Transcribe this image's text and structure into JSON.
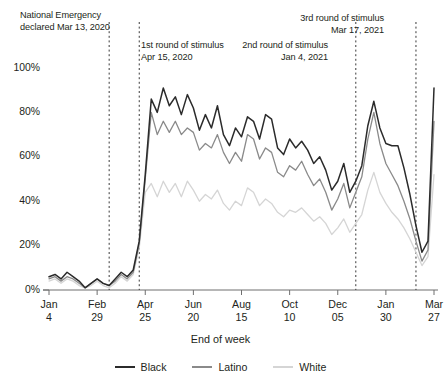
{
  "chart_data": {
    "type": "line",
    "title": "",
    "xlabel": "End of week",
    "ylabel": "",
    "ylim": [
      0,
      100
    ],
    "ytick_labels": [
      "0%",
      "20%",
      "40%",
      "60%",
      "80%",
      "100%"
    ],
    "ytick_values": [
      0,
      20,
      40,
      60,
      80,
      100
    ],
    "grid": false,
    "legend_position": "bottom",
    "xtick_labels": [
      "Jan\n4",
      "Feb\n29",
      "Apr\n25",
      "Jun\n20",
      "Aug\n15",
      "Oct\n10",
      "Dec\n05",
      "Jan\n30",
      "Mar\n27"
    ],
    "xtick_indices": [
      0,
      8,
      16,
      24,
      32,
      40,
      48,
      56,
      64
    ],
    "x_count": 65,
    "annotations": [
      {
        "name": "national-emergency",
        "text": "National Emergency\ndeclared Mar 13, 2020",
        "x_index": 10,
        "line": true
      },
      {
        "name": "first-stimulus",
        "text": "1st round of stimulus\nApr 15, 2020",
        "x_index": 15,
        "line": true
      },
      {
        "name": "second-stimulus",
        "text": "2nd round of stimulus\nJan 4, 2021",
        "x_index": 51,
        "line": true
      },
      {
        "name": "third-stimulus",
        "text": "3rd round of stimulus\nMar 17, 2021",
        "x_index": 61,
        "line": true
      }
    ],
    "series": [
      {
        "name": "Black",
        "color": "#2b2b2b",
        "values": [
          6,
          7,
          5,
          8,
          6,
          4,
          1,
          3,
          5,
          3,
          2,
          5,
          8,
          6,
          9,
          22,
          52,
          86,
          80,
          91,
          83,
          87,
          79,
          88,
          82,
          72,
          79,
          73,
          83,
          70,
          65,
          73,
          69,
          78,
          76,
          68,
          79,
          77,
          64,
          61,
          68,
          64,
          67,
          63,
          57,
          60,
          54,
          45,
          49,
          57,
          44,
          49,
          56,
          74,
          85,
          73,
          66,
          65,
          65,
          55,
          43,
          29,
          17,
          22,
          91
        ]
      },
      {
        "name": "Latino",
        "color": "#8a8a8a",
        "values": [
          5,
          6,
          4,
          6,
          5,
          3,
          1,
          3,
          5,
          3,
          2,
          4,
          7,
          5,
          8,
          21,
          50,
          80,
          70,
          76,
          71,
          76,
          70,
          73,
          71,
          63,
          66,
          64,
          70,
          62,
          57,
          62,
          58,
          70,
          68,
          59,
          64,
          62,
          53,
          51,
          56,
          54,
          58,
          52,
          47,
          50,
          44,
          36,
          41,
          48,
          37,
          44,
          51,
          68,
          80,
          66,
          57,
          52,
          47,
          40,
          32,
          22,
          13,
          18,
          76
        ]
      },
      {
        "name": "White",
        "color": "#d5d5d5",
        "values": [
          4,
          5,
          3,
          5,
          4,
          2,
          1,
          2,
          4,
          2,
          1,
          3,
          6,
          4,
          7,
          19,
          44,
          48,
          42,
          49,
          44,
          48,
          42,
          49,
          45,
          40,
          43,
          41,
          45,
          39,
          36,
          40,
          38,
          46,
          44,
          38,
          41,
          39,
          35,
          33,
          36,
          35,
          37,
          34,
          31,
          33,
          30,
          25,
          28,
          32,
          26,
          30,
          34,
          45,
          53,
          44,
          39,
          35,
          32,
          28,
          23,
          17,
          11,
          15,
          52
        ]
      }
    ]
  },
  "axis": {
    "ytitle": "",
    "xtitle": "End of week"
  },
  "legend": {
    "items": [
      {
        "label": "Black",
        "color": "#2b2b2b"
      },
      {
        "label": "Latino",
        "color": "#8a8a8a"
      },
      {
        "label": "White",
        "color": "#d5d5d5"
      }
    ]
  },
  "colors": {
    "axis": "#6f6f6f",
    "dashed_line": "#3a3a3a",
    "text": "#231f20",
    "background": "#ffffff"
  }
}
